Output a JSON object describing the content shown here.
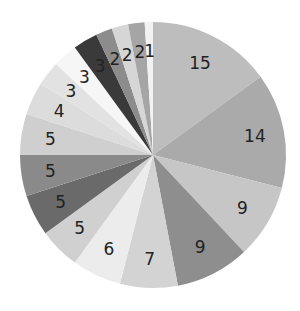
{
  "chart_data": {
    "type": "pie",
    "title": "",
    "start_angle": "12 o'clock",
    "direction": "clockwise",
    "values": [
      15,
      14,
      9,
      9,
      7,
      6,
      5,
      5,
      5,
      5,
      4,
      3,
      3,
      3,
      2,
      2,
      2,
      1
    ],
    "labels": [
      "15",
      "14",
      "9",
      "9",
      "7",
      "6",
      "5",
      "5",
      "5",
      "5",
      "4",
      "3",
      "3",
      "3",
      "2",
      "2",
      "2",
      "1"
    ],
    "colors": [
      "#bdbdbd",
      "#aaaaaa",
      "#c6c6c6",
      "#8e8e8e",
      "#d3d3d3",
      "#ececec",
      "#d0d0d0",
      "#6a6a6a",
      "#8a8a8a",
      "#cfcfcf",
      "#dcdcdc",
      "#e2e2e2",
      "#f6f6f6",
      "#3a3a3a",
      "#8c8c8c",
      "#d6d6d6",
      "#a5a5a5",
      "#f2f2f2"
    ],
    "legend": false,
    "data_labels": true
  }
}
